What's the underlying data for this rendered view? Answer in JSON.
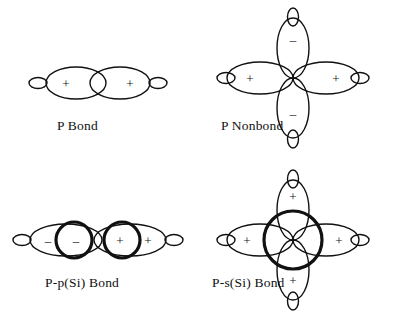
{
  "document": {
    "type": "orbital-overlap-diagram-figure",
    "background_color": "#ffffff",
    "stroke_color": "#111111",
    "panel_count": 4
  },
  "panels": [
    {
      "id": "p-bond",
      "caption": "P Bond",
      "orientation": "horizontal",
      "description": "Two overlapping p orbitals forming a sigma-type bond",
      "lobes": [
        {
          "position": "left-major",
          "sign": "+",
          "size": "large"
        },
        {
          "position": "left-minor",
          "sign": "",
          "size": "small"
        },
        {
          "position": "right-major",
          "sign": "+",
          "size": "large"
        },
        {
          "position": "right-minor",
          "sign": "",
          "size": "small"
        }
      ],
      "overlap_circles": 0
    },
    {
      "id": "p-nonbond",
      "caption": "P Nonbond",
      "orientation": "cross",
      "description": "Four lobed cross arrangement, horizontal lobes positive, vertical lobes negative",
      "lobes": [
        {
          "position": "left",
          "sign": "+",
          "size": "large"
        },
        {
          "position": "right",
          "sign": "+",
          "size": "large"
        },
        {
          "position": "top",
          "sign": "–",
          "size": "large"
        },
        {
          "position": "bottom",
          "sign": "–",
          "size": "large"
        },
        {
          "position": "left-minor",
          "sign": "",
          "size": "small"
        },
        {
          "position": "right-minor",
          "sign": "",
          "size": "small"
        },
        {
          "position": "top-minor",
          "sign": "",
          "size": "small"
        },
        {
          "position": "bottom-minor",
          "sign": "",
          "size": "small"
        }
      ],
      "overlap_circles": 0
    },
    {
      "id": "pp-si-bond",
      "caption": "P-p(Si) Bond",
      "orientation": "horizontal",
      "description": "Two p orbitals overlapped by two heavy silicon p circles",
      "lobes": [
        {
          "position": "left-major",
          "sign": "–",
          "size": "large"
        },
        {
          "position": "left-minor",
          "sign": "",
          "size": "small"
        },
        {
          "position": "right-major",
          "sign": "+",
          "size": "large"
        },
        {
          "position": "right-minor",
          "sign": "",
          "size": "small"
        }
      ],
      "overlap_circles": 2,
      "circle_signs": [
        "–",
        "+"
      ]
    },
    {
      "id": "ps-si-bond",
      "caption": "P-s(Si) Bond",
      "orientation": "cross",
      "description": "Four positive lobes in a cross overlapped by one large heavy silicon s circle",
      "lobes": [
        {
          "position": "left",
          "sign": "+",
          "size": "large"
        },
        {
          "position": "right",
          "sign": "+",
          "size": "large"
        },
        {
          "position": "top",
          "sign": "+",
          "size": "large"
        },
        {
          "position": "bottom",
          "sign": "+",
          "size": "large"
        },
        {
          "position": "left-minor",
          "sign": "",
          "size": "small"
        },
        {
          "position": "right-minor",
          "sign": "",
          "size": "small"
        },
        {
          "position": "top-minor",
          "sign": "",
          "size": "small"
        },
        {
          "position": "bottom-minor",
          "sign": "",
          "size": "small"
        }
      ],
      "overlap_circles": 1
    }
  ],
  "signs": {
    "plus": "+",
    "minus": "–"
  }
}
